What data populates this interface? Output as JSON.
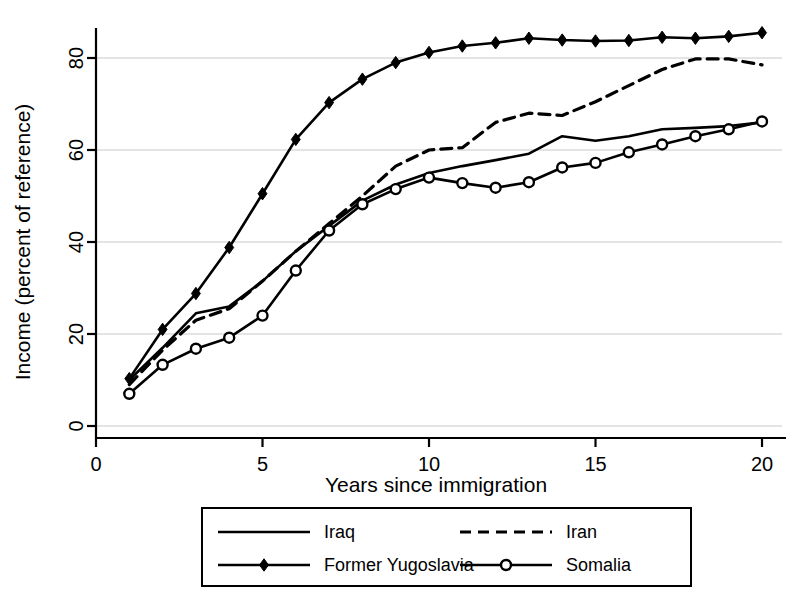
{
  "chart_data": {
    "type": "line",
    "title": "",
    "xlabel": "Years since immigration",
    "ylabel": "Income (percent of reference)",
    "xlim": [
      0,
      20.6
    ],
    "ylim": [
      -2,
      88
    ],
    "xticks": [
      0,
      5,
      10,
      15,
      20
    ],
    "xtick_labels": [
      "0",
      "5",
      "10",
      "15",
      "20"
    ],
    "yticks": [
      0,
      20,
      40,
      60,
      80
    ],
    "ytick_labels": [
      "0",
      "20",
      "40",
      "60",
      "80"
    ],
    "grid": "horizontal",
    "grid_color": "#c9c9c9",
    "legend_position": "below",
    "x": [
      1,
      2,
      3,
      4,
      5,
      6,
      7,
      8,
      9,
      10,
      11,
      12,
      13,
      14,
      15,
      16,
      17,
      18,
      19,
      20
    ],
    "series": [
      {
        "name": "Iraq",
        "style": "solid",
        "marker": "none",
        "color": "#000000",
        "values": [
          10.0,
          17.0,
          24.5,
          26.0,
          31.5,
          38.0,
          43.5,
          49.0,
          52.5,
          55.0,
          56.5,
          57.8,
          59.2,
          63.0,
          62.0,
          63.0,
          64.5,
          64.8,
          65.2,
          66.0
        ]
      },
      {
        "name": "Iran",
        "style": "dashed",
        "marker": "none",
        "color": "#000000",
        "values": [
          9.0,
          16.5,
          23.0,
          25.5,
          31.5,
          38.0,
          44.0,
          50.0,
          56.5,
          60.0,
          60.5,
          66.0,
          68.0,
          67.5,
          70.5,
          74.0,
          77.5,
          79.8,
          79.8,
          78.5
        ]
      },
      {
        "name": "Former Yugoslavia",
        "style": "solid",
        "marker": "diamond",
        "color": "#000000",
        "values": [
          10.3,
          21.0,
          28.8,
          38.8,
          50.5,
          62.3,
          70.3,
          75.4,
          79.0,
          81.2,
          82.6,
          83.3,
          84.3,
          83.9,
          83.7,
          83.8,
          84.5,
          84.3,
          84.7,
          85.5
        ]
      },
      {
        "name": "Somalia",
        "style": "solid",
        "marker": "circle",
        "color": "#000000",
        "values": [
          7.0,
          13.3,
          16.8,
          19.2,
          24.0,
          33.8,
          42.5,
          48.2,
          51.5,
          54.0,
          52.8,
          51.8,
          53.0,
          56.2,
          57.2,
          59.5,
          61.2,
          63.0,
          64.5,
          66.2
        ]
      }
    ]
  },
  "legend": {
    "entries": [
      {
        "label": "Iraq",
        "style": "solid",
        "marker": "none"
      },
      {
        "label": "Iran",
        "style": "dashed",
        "marker": "none"
      },
      {
        "label": "Former Yugoslavia",
        "style": "solid",
        "marker": "diamond"
      },
      {
        "label": "Somalia",
        "style": "solid",
        "marker": "circle"
      }
    ]
  }
}
